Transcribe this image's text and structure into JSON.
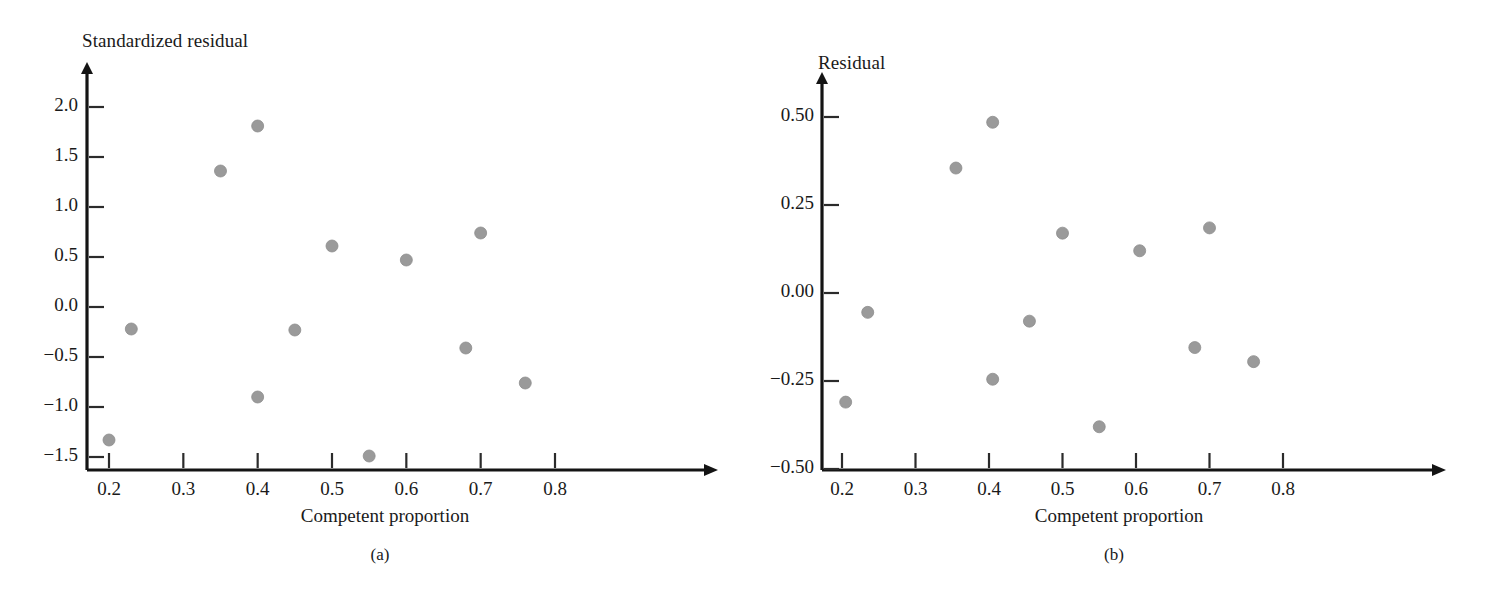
{
  "figure": {
    "caption_a": "(a)",
    "caption_b": "(b)"
  },
  "chart_data": [
    {
      "type": "scatter",
      "panel": "a",
      "title": "",
      "xlabel": "Competent proportion",
      "ylabel": "Standardized residual",
      "xlim": [
        0.16,
        0.845
      ],
      "ylim": [
        -1.6,
        2.25
      ],
      "xticks": [
        0.2,
        0.3,
        0.4,
        0.5,
        0.6,
        0.7,
        0.8
      ],
      "xtick_labels": [
        "0.2",
        "0.3",
        "0.4",
        "0.5",
        "0.6",
        "0.7",
        "0.8"
      ],
      "yticks": [
        2.0,
        1.5,
        1.0,
        0.5,
        0.0,
        -0.5,
        -1.0,
        -1.5
      ],
      "ytick_labels": [
        "2.0",
        "1.5",
        "1.0",
        "0.5",
        "0.0",
        "−0.5",
        "−1.0",
        "−1.5"
      ],
      "grid": false,
      "legend": "none",
      "marker_color": "#9a9a9a",
      "axis_color": "#141414",
      "x": [
        0.2,
        0.23,
        0.35,
        0.4,
        0.4,
        0.45,
        0.5,
        0.55,
        0.6,
        0.68,
        0.7,
        0.76
      ],
      "y": [
        -1.33,
        -0.22,
        1.36,
        1.81,
        -0.9,
        -0.23,
        0.61,
        -1.49,
        0.47,
        -0.41,
        0.74,
        -0.76
      ]
    },
    {
      "type": "scatter",
      "panel": "b",
      "title": "",
      "xlabel": "Competent proportion",
      "ylabel": "Residual",
      "xlim": [
        0.16,
        0.845
      ],
      "ylim": [
        -0.52,
        0.56
      ],
      "xticks": [
        0.2,
        0.3,
        0.4,
        0.5,
        0.6,
        0.7,
        0.8
      ],
      "xtick_labels": [
        "0.2",
        "0.3",
        "0.4",
        "0.5",
        "0.6",
        "0.7",
        "0.8"
      ],
      "yticks": [
        0.5,
        0.25,
        0.0,
        -0.25,
        -0.5
      ],
      "ytick_labels": [
        "0.50",
        "0.25",
        "0.00",
        "−0.25",
        "−0.50"
      ],
      "grid": false,
      "legend": "none",
      "marker_color": "#9a9a9a",
      "axis_color": "#141414",
      "x": [
        0.205,
        0.235,
        0.355,
        0.405,
        0.405,
        0.455,
        0.5,
        0.55,
        0.605,
        0.68,
        0.7,
        0.76
      ],
      "y": [
        -0.31,
        -0.055,
        0.355,
        0.485,
        -0.245,
        -0.08,
        0.17,
        -0.38,
        0.12,
        -0.155,
        0.185,
        -0.195
      ]
    }
  ]
}
